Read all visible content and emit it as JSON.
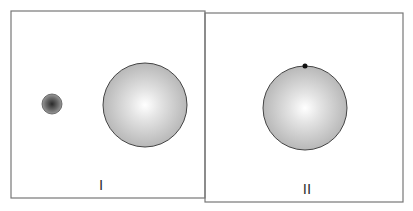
{
  "diagram": {
    "panels": [
      {
        "label": "I",
        "objects": [
          {
            "type": "small-dark-sphere",
            "cx": 52,
            "cy": 104,
            "r": 10
          },
          {
            "type": "large-light-sphere",
            "cx": 145,
            "cy": 105,
            "r": 42
          }
        ]
      },
      {
        "label": "II",
        "objects": [
          {
            "type": "large-light-sphere",
            "cx": 305,
            "cy": 108,
            "r": 42
          },
          {
            "type": "small-black-dot-on-surface",
            "cx": 305,
            "cy": 66,
            "r": 2.5
          }
        ]
      }
    ],
    "colors": {
      "border": "#666666",
      "sphere_edge": "#444444",
      "dot": "#111111"
    }
  }
}
